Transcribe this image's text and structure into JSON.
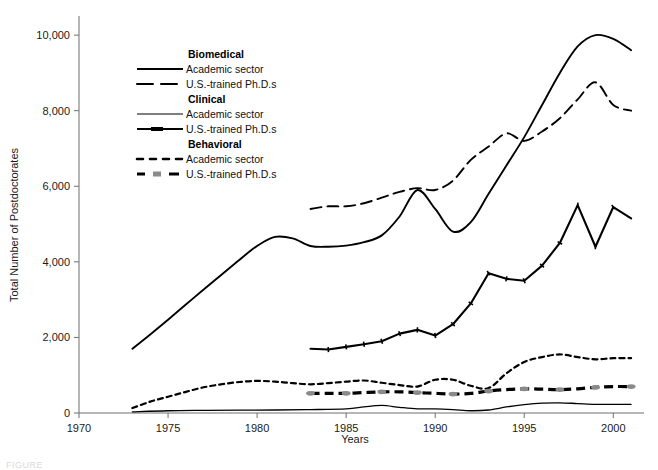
{
  "chart_data": {
    "type": "line",
    "title": "",
    "xlabel": "Years",
    "ylabel": "Total Number of Postdoctorates",
    "xlim": [
      1970,
      2001.5
    ],
    "ylim": [
      0,
      10400
    ],
    "grid": false,
    "legend_position": "upper-left-inside",
    "xticks": [
      "1970",
      "1975",
      "1980",
      "1985",
      "1990",
      "1995",
      "2000"
    ],
    "xtick_values": [
      1970,
      1975,
      1980,
      1985,
      1990,
      1995,
      2000
    ],
    "yticks": [
      "0",
      "2,000",
      "4,000",
      "6,000",
      "8,000",
      "10,000"
    ],
    "ytick_values": [
      0,
      2000,
      4000,
      6000,
      8000,
      10000
    ],
    "series": [
      {
        "name": "Biomedical Academic sector",
        "group": "Biomedical",
        "measure": "Academic sector",
        "style": "solid",
        "color": "#000000",
        "width": 1.9,
        "x": [
          1973,
          1974,
          1975,
          1976,
          1977,
          1978,
          1979,
          1980,
          1981,
          1982,
          1983,
          1984,
          1985,
          1986,
          1987,
          1988,
          1989,
          1990,
          1991,
          1992,
          1993,
          1994,
          1995,
          1996,
          1997,
          1998,
          1999,
          2000,
          2001
        ],
        "values": [
          1700,
          2080,
          2470,
          2870,
          3270,
          3660,
          4050,
          4420,
          4660,
          4620,
          4420,
          4400,
          4430,
          4520,
          4700,
          5200,
          5900,
          5400,
          4800,
          5050,
          5800,
          6550,
          7300,
          8150,
          9000,
          9700,
          10000,
          9900,
          9600
        ]
      },
      {
        "name": "Biomedical U.S.-trained Ph.D.s",
        "group": "Biomedical",
        "measure": "U.S.-trained Ph.D.s",
        "style": "dashed",
        "color": "#000000",
        "width": 1.9,
        "x": [
          1983,
          1984,
          1985,
          1986,
          1987,
          1988,
          1989,
          1990,
          1991,
          1992,
          1993,
          1994,
          1995,
          1996,
          1997,
          1998,
          1999,
          2000,
          2001
        ],
        "values": [
          5400,
          5470,
          5470,
          5550,
          5700,
          5850,
          5950,
          5900,
          6150,
          6700,
          7050,
          7400,
          7200,
          7450,
          7800,
          8300,
          8750,
          8150,
          8000
        ]
      },
      {
        "name": "Clinical Academic sector",
        "group": "Clinical",
        "measure": "Academic sector",
        "style": "solid-thin",
        "color": "#000000",
        "width": 1.3,
        "x": [
          1973,
          1975,
          1977,
          1979,
          1981,
          1983,
          1985,
          1986,
          1987,
          1988,
          1989,
          1990,
          1991,
          1992,
          1993,
          1994,
          1995,
          1996,
          1997,
          1998,
          1999,
          2000,
          2001
        ],
        "values": [
          30,
          60,
          70,
          75,
          80,
          90,
          110,
          160,
          200,
          150,
          110,
          110,
          90,
          60,
          80,
          160,
          220,
          260,
          270,
          250,
          230,
          230,
          230
        ]
      },
      {
        "name": "Clinical U.S.-trained Ph.D.s",
        "group": "Clinical",
        "measure": "U.S.-trained Ph.D.s",
        "style": "solid-ticked",
        "color": "#000000",
        "width": 2.1,
        "x": [
          1983,
          1984,
          1985,
          1986,
          1987,
          1988,
          1989,
          1990,
          1991,
          1992,
          1993,
          1994,
          1995,
          1996,
          1997,
          1998,
          1999,
          2000,
          2001
        ],
        "values": [
          1700,
          1680,
          1750,
          1820,
          1900,
          2100,
          2200,
          2050,
          2350,
          2900,
          3700,
          3550,
          3500,
          3900,
          4500,
          5500,
          4400,
          5450,
          5150
        ]
      },
      {
        "name": "Behavioral Academic sector",
        "group": "Behavioral",
        "measure": "Academic sector",
        "style": "dotted",
        "color": "#000000",
        "width": 2.2,
        "x": [
          1973,
          1974,
          1975,
          1976,
          1977,
          1978,
          1979,
          1980,
          1981,
          1982,
          1983,
          1984,
          1985,
          1986,
          1987,
          1988,
          1989,
          1990,
          1991,
          1992,
          1993,
          1994,
          1995,
          1996,
          1997,
          1998,
          1999,
          2000,
          2001
        ],
        "values": [
          130,
          300,
          430,
          560,
          680,
          760,
          820,
          850,
          830,
          790,
          760,
          790,
          830,
          860,
          800,
          740,
          700,
          880,
          880,
          720,
          660,
          1050,
          1350,
          1480,
          1550,
          1480,
          1420,
          1450,
          1450
        ]
      },
      {
        "name": "Behavioral U.S.-trained Ph.D.s",
        "group": "Behavioral",
        "measure": "U.S.-trained Ph.D.s",
        "style": "dashed-marker",
        "color": "#8a8a8a",
        "width": 3.2,
        "x": [
          1983,
          1984,
          1985,
          1986,
          1987,
          1988,
          1989,
          1990,
          1991,
          1992,
          1993,
          1994,
          1995,
          1996,
          1997,
          1998,
          1999,
          2000,
          2001
        ],
        "values": [
          520,
          520,
          520,
          540,
          560,
          560,
          540,
          520,
          500,
          520,
          580,
          620,
          640,
          630,
          620,
          640,
          680,
          700,
          700
        ]
      }
    ],
    "legend": [
      {
        "group": "Biomedical",
        "entries": [
          {
            "label": "Academic sector",
            "style": "solid"
          },
          {
            "label": "U.S.-trained Ph.D.s",
            "style": "dashed"
          }
        ]
      },
      {
        "group": "Clinical",
        "entries": [
          {
            "label": "Academic sector",
            "style": "solid-thin"
          },
          {
            "label": "U.S.-trained Ph.D.s",
            "style": "solid-ticked"
          }
        ]
      },
      {
        "group": "Behavioral",
        "entries": [
          {
            "label": "Academic sector",
            "style": "dotted"
          },
          {
            "label": "U.S.-trained Ph.D.s",
            "style": "dashed-marker"
          }
        ]
      }
    ]
  },
  "caption": {
    "text": "FIGURE"
  }
}
